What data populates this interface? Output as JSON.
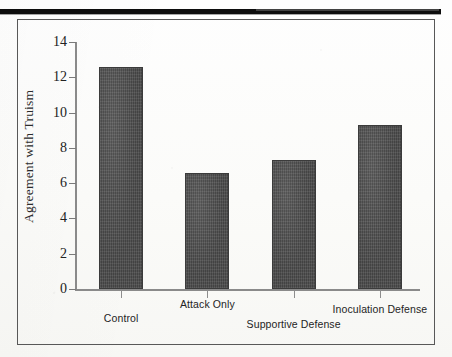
{
  "chart_data": {
    "type": "bar",
    "title": "",
    "subtitle": "",
    "xlabel": "",
    "ylabel": "Agreement with Truism",
    "categories": [
      "Control",
      "Attack Only",
      "Supportive Defense",
      "Inoculation Defense"
    ],
    "values": [
      12.6,
      6.6,
      7.3,
      9.3
    ],
    "ylim": [
      0,
      14
    ],
    "yticks": [
      0,
      2,
      4,
      6,
      8,
      10,
      12,
      14
    ],
    "ytick_labels": [
      "0",
      "2",
      "4",
      "6",
      "8",
      "10",
      "12",
      "14"
    ],
    "grid": false,
    "legend": null,
    "bar_color": "#4a4a4a",
    "axis_color": "#8a8a8a",
    "frame_color": "#585858",
    "text_color": "#242424"
  },
  "figure": {
    "top_rule_color": "#0d0d0d",
    "background_color": "#fdfdfc"
  }
}
